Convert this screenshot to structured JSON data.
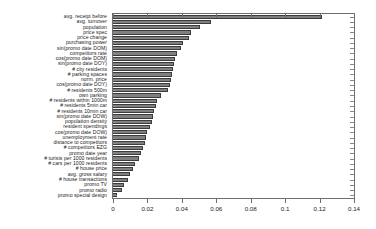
{
  "chart_data": {
    "type": "bar",
    "orientation": "horizontal",
    "title": "",
    "xlabel": "",
    "ylabel": "",
    "xlim": [
      0,
      0.14
    ],
    "ylim": [
      0,
      36
    ],
    "grid": false,
    "legend": null,
    "bar_color": "#7f7f7f",
    "bar_edge_color": "#3c3c3c",
    "xticks": [
      0,
      0.02,
      0.04,
      0.06,
      0.08,
      0.1,
      0.12,
      0.14
    ],
    "xtick_labels": [
      "0",
      "0.02",
      "0.04",
      "0.06",
      "0.08",
      "0.1",
      "0.12",
      "0.14"
    ],
    "categories": [
      "avg. receipt before",
      "avg. turnover",
      "population",
      "price spec",
      "price change",
      "purchasing power",
      "sin(promo date DOM)",
      "competitors rate",
      "cos(promo date DOM)",
      "sin(promo date DOY)",
      "# city residents",
      "# parking spaces",
      "norm. price",
      "cos(promo date DOY)",
      "# residents 500m",
      "own parking",
      "# residents within 1000m",
      "# residents 5min car",
      "# residents 10min car",
      "sin(promo date DOW)",
      "population density",
      "resident spendings",
      "cos(promo date DOW)",
      "unemployment rate",
      "distance to competitors",
      "# competitors EZG",
      "promo date year",
      "# turists per 1000 residents",
      "# cars per 1000 residents",
      "# house price",
      "avg. gross salary",
      "# house transactions",
      "promo TV",
      "promo radio",
      "promo special design"
    ],
    "values": [
      0.1212,
      0.0572,
      0.0508,
      0.0455,
      0.0444,
      0.0408,
      0.0395,
      0.0372,
      0.0362,
      0.0355,
      0.035,
      0.0345,
      0.0338,
      0.033,
      0.032,
      0.028,
      0.0258,
      0.0248,
      0.024,
      0.0232,
      0.0224,
      0.0214,
      0.02,
      0.019,
      0.0185,
      0.0172,
      0.0165,
      0.0152,
      0.013,
      0.0118,
      0.01,
      0.009,
      0.0062,
      0.005,
      0.0022
    ]
  }
}
